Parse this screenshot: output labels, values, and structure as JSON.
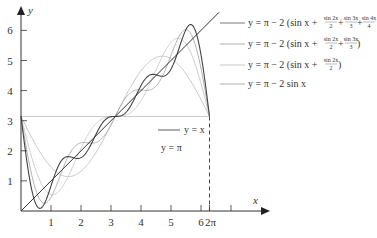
{
  "chart_data": {
    "type": "line",
    "title": "",
    "xlabel": "x",
    "ylabel": "y",
    "xlim": [
      0,
      7.4
    ],
    "ylim": [
      0,
      6.6
    ],
    "x_ticks": [
      1,
      2,
      3,
      4,
      5,
      6,
      7
    ],
    "x_tick_labels": [
      "1",
      "2",
      "3",
      "4",
      "5",
      "6",
      ""
    ],
    "extra_x_tick": {
      "value": 6.2832,
      "label": "2π"
    },
    "y_ticks": [
      1,
      2,
      3,
      4,
      5,
      6
    ],
    "y_tick_labels": [
      "1",
      "2",
      "3",
      "4",
      "5",
      "6"
    ],
    "grid": false,
    "series": [
      {
        "name": "y = x",
        "kind": "line",
        "label": "y = x",
        "color": "#333333",
        "terms": 0
      },
      {
        "name": "y = π",
        "kind": "hline",
        "value": 3.14159,
        "label": "y = π",
        "color": "#c8c8c8"
      },
      {
        "name": "y = π − 2 sin x",
        "terms": 1,
        "color": "#bdbdbd",
        "label_parts": [
          "y = π − 2 sin x"
        ]
      },
      {
        "name": "y = π − 2 (sin x + sin 2x/2)",
        "terms": 2,
        "color": "#c8c8c8",
        "label_parts": [
          "y = π − 2 (sin x + ",
          "sin 2x",
          "2",
          " )"
        ]
      },
      {
        "name": "y = π − 2 (sin x + sin 2x/2 + sin 3x/3)",
        "terms": 3,
        "color": "#a8a8a8",
        "label_parts": [
          "y = π − 2 (sin x + ",
          "sin 2x",
          "2",
          " + ",
          "sin 3x",
          "3",
          " )"
        ]
      },
      {
        "name": "y = π − 2 (sin x + sin 2x/2 + sin 3x/3 + sin 4x/4)",
        "terms": 4,
        "color": "#444444",
        "label_parts": [
          "y = π − 2 (sin x + ",
          "sin 2x",
          "2",
          " + ",
          "sin 3x",
          "3",
          " + ",
          "sin 4x",
          "4",
          " )"
        ]
      }
    ],
    "annotations": [
      {
        "text": "y = x",
        "near": "x≈4.6"
      },
      {
        "text": "y = π",
        "near": "below horizontal line at π"
      },
      {
        "text": "dashed vertical line at x = 2π",
        "value": 6.2832
      }
    ]
  },
  "labels": {
    "x_axis": "x",
    "y_axis": "y",
    "yx": "y = x",
    "ypi": "y = π",
    "two_pi": "2π",
    "s1": "y = π − 2 sin x",
    "s2_a": "y = π − 2 (sin x + ",
    "s2_f1n": "sin 2x",
    "s2_f1d": "2",
    "s2_b": " )",
    "s3_a": "y = π − 2 (sin x + ",
    "s3_f1n": "sin 2x",
    "s3_f1d": "2",
    "s3_plus": " + ",
    "s3_f2n": "sin 3x",
    "s3_f2d": "3",
    "s3_b": " )",
    "s4_a": "y = π − 2 (sin x + ",
    "s4_f1n": "sin 2x",
    "s4_f1d": "2",
    "s4_plus1": " + ",
    "s4_f2n": "sin 3x",
    "s4_f2d": "3",
    "s4_plus2": " + ",
    "s4_f3n": "sin 4x",
    "s4_f3d": "4",
    "s4_b": " )"
  }
}
